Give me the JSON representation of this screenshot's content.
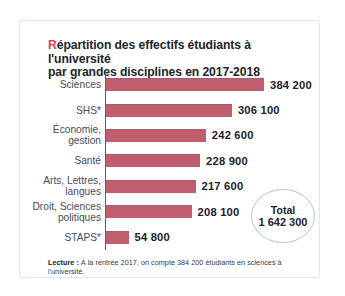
{
  "card": {
    "title": {
      "first_letter": "R",
      "rest_line1": "épartition des effectifs étudiants à l'université",
      "line2": "par grandes disciplines en 2017-2018",
      "accent_color": "#e8404f"
    },
    "footer": {
      "label": "Lecture :",
      "text": " À la rentrée 2017, on compte 384 200 étudiants en sciences à l'université."
    }
  },
  "total_badge": {
    "label": "Total",
    "value": "1 642 300"
  },
  "chart_data": {
    "type": "bar",
    "orientation": "horizontal",
    "title": "Répartition des effectifs étudiants à l'université par grandes disciplines en 2017-2018",
    "categories": [
      "Sciences",
      "SHS*",
      "Économie,\ngestion",
      "Santé",
      "Arts, Lettres,\nlangues",
      "Droit, Sciences\npolitiques",
      "STAPS*"
    ],
    "values": [
      384200,
      306100,
      242600,
      228900,
      217600,
      208100,
      54800
    ],
    "value_labels": [
      "384 200",
      "306 100",
      "242 600",
      "228 900",
      "217 600",
      "208 100",
      "54 800"
    ],
    "total": 1642300,
    "bar_color": "#c05e6d",
    "xlim": [
      0,
      400000
    ],
    "grid": false,
    "legend": false
  }
}
